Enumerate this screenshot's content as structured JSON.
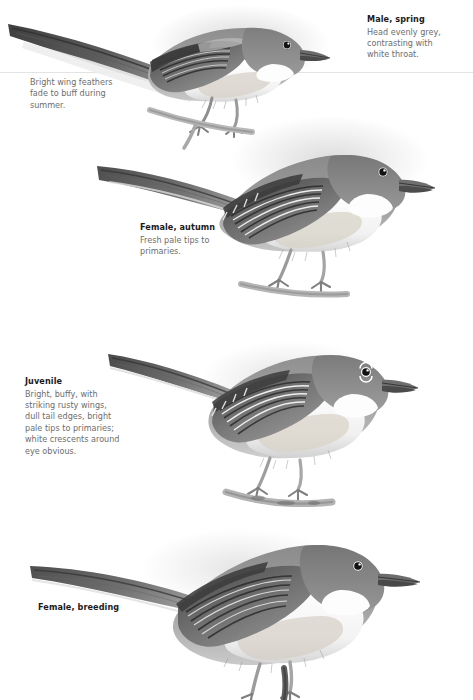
{
  "page": {
    "background_color": "#ffffff",
    "width": 473,
    "height": 700,
    "plate_type": "bird-field-guide-plate",
    "rule_color": "#e3e3e3",
    "heading_color": "#1a1a1a",
    "body_color": "#6d6d6d"
  },
  "captions": [
    {
      "id": "male-spring",
      "title": "Male, spring",
      "lines": [
        "Head evenly grey,",
        "contrasting with",
        "white throat."
      ]
    },
    {
      "id": "wing-fade-note",
      "title": "",
      "lines": [
        "Bright wing feathers",
        "fade to buff during",
        "summer."
      ]
    },
    {
      "id": "female-autumn",
      "title": "Female, autumn",
      "lines": [
        "Fresh pale tips to",
        "primaries."
      ]
    },
    {
      "id": "juvenile",
      "title": "Juvenile",
      "lines": [
        "Bright, buffy, with",
        "striking rusty wings,",
        "dull tail edges, bright",
        "pale tips to primaries;",
        "white crescents around",
        "eye obvious."
      ]
    },
    {
      "id": "female-breeding",
      "title": "Female, breeding",
      "lines": []
    }
  ],
  "figures": [
    {
      "id": "bird-male-spring",
      "label": "Male, spring",
      "pose": "perched-on-branch-facing-right",
      "plumage": "grey head, white throat, dark wing feathers, buff flanks"
    },
    {
      "id": "bird-female-autumn",
      "label": "Female, autumn",
      "pose": "perched-on-branch-facing-right",
      "plumage": "brown head, white throat, pale fringed primaries"
    },
    {
      "id": "bird-juvenile",
      "label": "Juvenile",
      "pose": "perched-on-branch-facing-right",
      "plumage": "buffy body, rusty wings, white eye crescents"
    },
    {
      "id": "bird-female-breeding",
      "label": "Female, breeding",
      "pose": "perched-on-branch-facing-right",
      "plumage": "brown upperparts, white underparts, long tail"
    }
  ]
}
